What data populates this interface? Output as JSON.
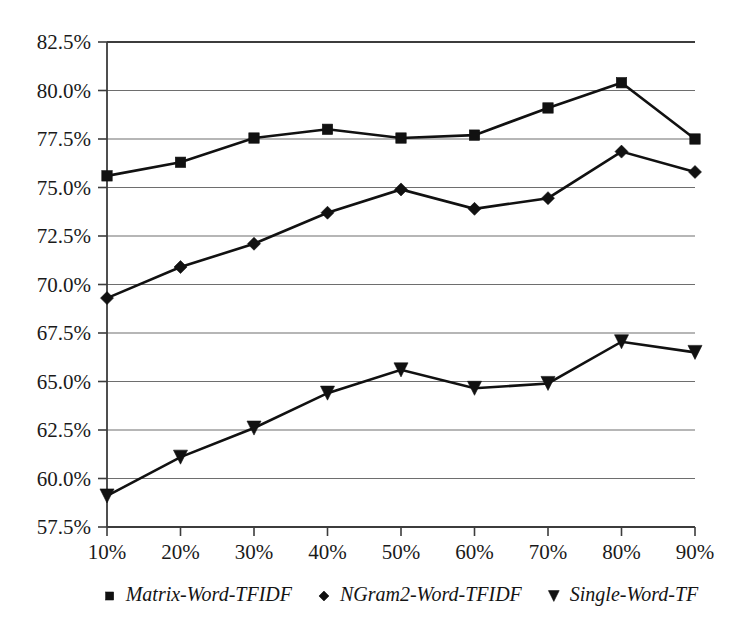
{
  "chart_data": {
    "type": "line",
    "title": "",
    "subtitle": "",
    "xlabel": "",
    "ylabel": "",
    "categories": [
      "10%",
      "20%",
      "30%",
      "40%",
      "50%",
      "60%",
      "70%",
      "80%",
      "90%"
    ],
    "x": [
      10,
      20,
      30,
      40,
      50,
      60,
      70,
      80,
      90
    ],
    "xlim": [
      10,
      90
    ],
    "ylim": [
      57.5,
      82.5
    ],
    "y_tick_labels": [
      "82.5%",
      "80.0%",
      "77.5%",
      "75.0%",
      "72.5%",
      "70.0%",
      "67.5%",
      "65.0%",
      "62.5%",
      "60.0%",
      "57.5%"
    ],
    "y_tick_values": [
      82.5,
      80.0,
      77.5,
      75.0,
      72.5,
      70.0,
      67.5,
      65.0,
      62.5,
      60.0,
      57.5
    ],
    "x_tick_labels": [
      "10%",
      "20%",
      "30%",
      "40%",
      "50%",
      "60%",
      "70%",
      "80%",
      "90%"
    ],
    "grid": true,
    "grid_axis": "y",
    "legend_position": "bottom",
    "series": [
      {
        "name": "Matrix-Word-TFIDF",
        "marker": "square",
        "color": "#111111",
        "values": [
          75.6,
          76.3,
          77.55,
          78.0,
          77.55,
          77.7,
          79.1,
          80.4,
          77.5
        ]
      },
      {
        "name": "NGram2-Word-TFIDF",
        "marker": "diamond",
        "color": "#111111",
        "values": [
          69.3,
          70.9,
          72.1,
          73.7,
          74.9,
          73.9,
          74.45,
          76.85,
          75.8
        ]
      },
      {
        "name": "Single-Word-TF",
        "marker": "triangle-down",
        "color": "#111111",
        "values": [
          59.1,
          61.1,
          62.6,
          64.4,
          65.6,
          64.65,
          64.9,
          67.05,
          66.5
        ]
      }
    ]
  },
  "legend": {
    "items": [
      {
        "label": "Matrix-Word-TFIDF",
        "marker": "square"
      },
      {
        "label": "NGram2-Word-TFIDF",
        "marker": "diamond"
      },
      {
        "label": "Single-Word-TF",
        "marker": "triangle-down"
      }
    ]
  },
  "colors": {
    "ink": "#111111",
    "grid": "#6e6e6e",
    "axis": "#3c3c3c",
    "background": "#ffffff"
  }
}
